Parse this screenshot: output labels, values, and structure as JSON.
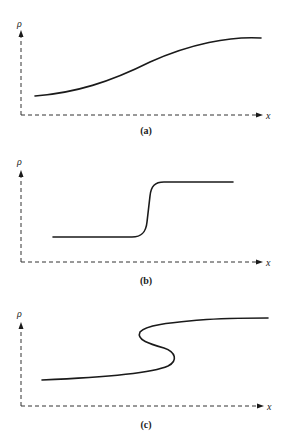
{
  "panels": [
    {
      "id": "a",
      "caption": "(a)",
      "y_label": "ρ",
      "x_label": "x",
      "description": "smooth gradual rise"
    },
    {
      "id": "b",
      "caption": "(b)",
      "y_label": "ρ",
      "x_label": "x",
      "description": "steep step-like transition"
    },
    {
      "id": "c",
      "caption": "(c)",
      "y_label": "ρ",
      "x_label": "x",
      "description": "multivalued S-shaped (overturned) profile"
    }
  ],
  "colors": {
    "line": "#1a1a1a",
    "axis": "#333333",
    "background": "#ffffff"
  }
}
